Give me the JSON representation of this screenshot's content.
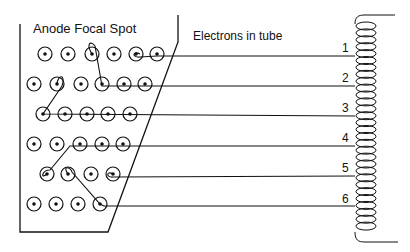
{
  "labels": {
    "anode": "Anode Focal Spot",
    "electrons": "Electrons in tube"
  },
  "channels": [
    {
      "num": "1",
      "y": 56
    },
    {
      "num": "2",
      "y": 86
    },
    {
      "num": "3",
      "y": 116
    },
    {
      "num": "4",
      "y": 146
    },
    {
      "num": "5",
      "y": 176
    },
    {
      "num": "6",
      "y": 206
    }
  ],
  "circle_rows": [
    {
      "y": 54,
      "xs": [
        45,
        68,
        92,
        114,
        136,
        157
      ]
    },
    {
      "y": 84,
      "xs": [
        34,
        57,
        81,
        102,
        124,
        145
      ]
    },
    {
      "y": 114,
      "xs": [
        43,
        65,
        87,
        108,
        130
      ]
    },
    {
      "y": 144,
      "xs": [
        34,
        57,
        80,
        102,
        123
      ]
    },
    {
      "y": 174,
      "xs": [
        47,
        68,
        91,
        113
      ]
    },
    {
      "y": 204,
      "xs": [
        34,
        56,
        78,
        100
      ]
    }
  ],
  "colors": {
    "stroke": "#111111",
    "background": "#ffffff"
  }
}
